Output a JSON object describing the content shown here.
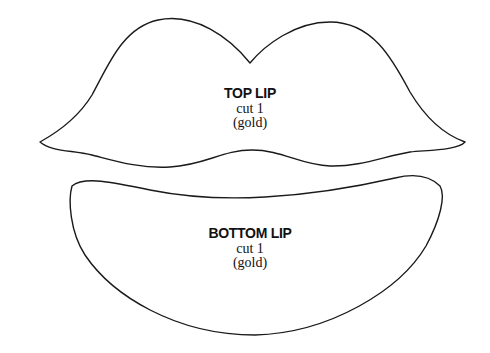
{
  "pieces": [
    {
      "id": "top-lip",
      "title": "TOP LIP",
      "quantity": "cut 1",
      "material": "(gold)"
    },
    {
      "id": "bottom-lip",
      "title": "BOTTOM LIP",
      "quantity": "cut 1",
      "material": "(gold)"
    }
  ],
  "colors": {
    "outline": "#1a1a1a",
    "fill": "#ffffff",
    "text": "#111111"
  }
}
